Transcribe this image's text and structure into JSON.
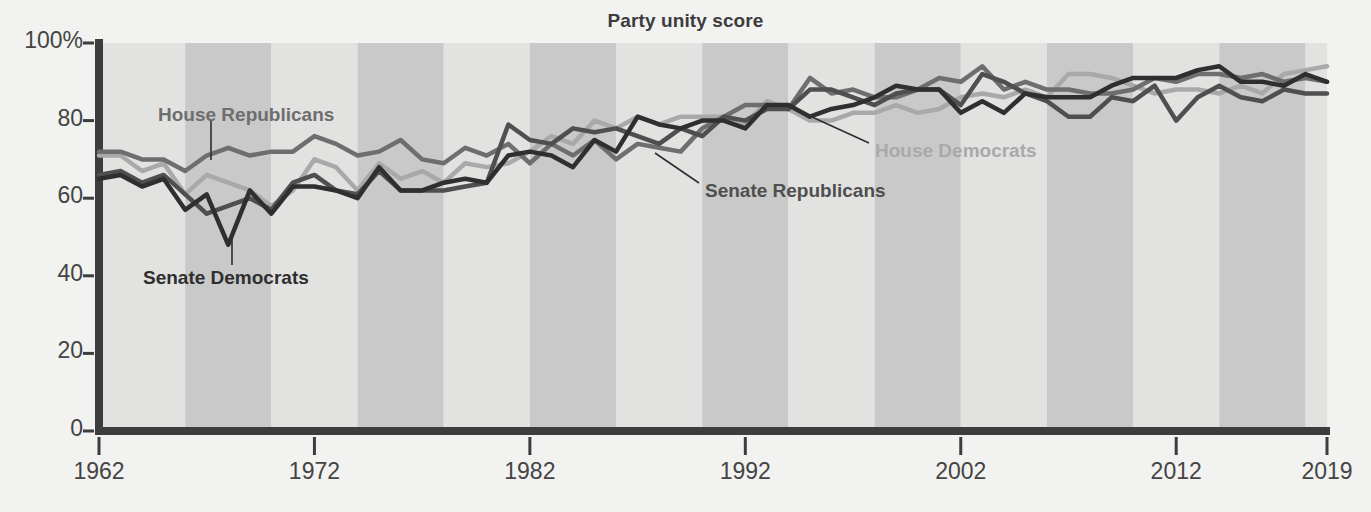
{
  "chart_data": {
    "type": "line",
    "title": "Party unity score",
    "xlabel": "",
    "ylabel": "",
    "xlim": [
      1962,
      2019
    ],
    "ylim": [
      0,
      100
    ],
    "grid": false,
    "legend_position": "inline-annotations",
    "x_tick_labels": [
      "1962",
      "1972",
      "1982",
      "1992",
      "2002",
      "2012",
      "2019"
    ],
    "x_ticks": [
      1962,
      1972,
      1982,
      1992,
      2002,
      2012,
      2019
    ],
    "y_tick_labels": [
      "0",
      "20",
      "40",
      "60",
      "80",
      "100%"
    ],
    "y_ticks": [
      0,
      20,
      40,
      60,
      80,
      100
    ],
    "x": [
      1962,
      1963,
      1964,
      1965,
      1966,
      1967,
      1968,
      1969,
      1970,
      1971,
      1972,
      1973,
      1974,
      1975,
      1976,
      1977,
      1978,
      1979,
      1980,
      1981,
      1982,
      1983,
      1984,
      1985,
      1986,
      1987,
      1988,
      1989,
      1990,
      1991,
      1992,
      1993,
      1994,
      1995,
      1996,
      1997,
      1998,
      1999,
      2000,
      2001,
      2002,
      2003,
      2004,
      2005,
      2006,
      2007,
      2008,
      2009,
      2010,
      2011,
      2012,
      2013,
      2014,
      2015,
      2016,
      2017,
      2018,
      2019
    ],
    "series": [
      {
        "name": "House Republicans",
        "color": "#6e6e6e",
        "values": [
          72,
          72,
          70,
          70,
          67,
          71,
          73,
          71,
          72,
          72,
          76,
          74,
          71,
          72,
          75,
          70,
          69,
          73,
          71,
          74,
          69,
          74,
          71,
          75,
          70,
          74,
          73,
          72,
          78,
          81,
          84,
          84,
          83,
          91,
          87,
          88,
          86,
          86,
          88,
          91,
          90,
          94,
          88,
          90,
          88,
          88,
          87,
          87,
          88,
          91,
          90,
          92,
          92,
          91,
          92,
          90,
          91,
          90
        ]
      },
      {
        "name": "House Democrats",
        "color": "#a9a9a9",
        "values": [
          71,
          71,
          67,
          69,
          61,
          66,
          64,
          62,
          58,
          62,
          70,
          68,
          62,
          69,
          65,
          67,
          64,
          69,
          68,
          69,
          72,
          76,
          74,
          80,
          78,
          81,
          79,
          81,
          81,
          81,
          79,
          85,
          83,
          80,
          80,
          82,
          82,
          84,
          82,
          83,
          86,
          87,
          86,
          88,
          86,
          92,
          92,
          91,
          89,
          87,
          88,
          88,
          87,
          89,
          87,
          92,
          93,
          94
        ]
      },
      {
        "name": "Senate Republicans",
        "color": "#4f4f4f",
        "values": [
          66,
          67,
          64,
          66,
          61,
          56,
          58,
          60,
          57,
          64,
          66,
          62,
          61,
          67,
          62,
          62,
          62,
          63,
          64,
          79,
          75,
          74,
          78,
          77,
          78,
          76,
          74,
          78,
          76,
          81,
          80,
          83,
          83,
          88,
          88,
          86,
          84,
          87,
          88,
          88,
          84,
          92,
          90,
          87,
          85,
          81,
          81,
          86,
          85,
          89,
          80,
          86,
          89,
          86,
          85,
          88,
          87,
          87
        ]
      },
      {
        "name": "Senate Democrats",
        "color": "#2f2f2f",
        "values": [
          65,
          66,
          63,
          65,
          57,
          61,
          48,
          62,
          56,
          63,
          63,
          62,
          60,
          68,
          62,
          62,
          64,
          65,
          64,
          71,
          72,
          71,
          68,
          75,
          72,
          81,
          79,
          78,
          80,
          80,
          78,
          84,
          84,
          81,
          83,
          84,
          86,
          89,
          88,
          88,
          82,
          85,
          82,
          87,
          86,
          86,
          86,
          89,
          91,
          91,
          91,
          93,
          94,
          90,
          90,
          89,
          92,
          90
        ]
      }
    ],
    "annotations": [
      {
        "name": "House Republicans",
        "text": "House Republicans",
        "color": "#6e6e6e",
        "label_x": 158,
        "label_y": 104,
        "leader": {
          "x1": 211,
          "y1": 120,
          "x2": 211,
          "y2": 160
        }
      },
      {
        "name": "Senate Democrats",
        "text": "Senate Democrats",
        "color": "#2f2f2f",
        "label_x": 143,
        "label_y": 267,
        "leader": {
          "x1": 232,
          "y1": 265,
          "x2": 232,
          "y2": 232
        }
      },
      {
        "name": "Senate Republicans",
        "text": "Senate Republicans",
        "color": "#4f4f4f",
        "label_x": 705,
        "label_y": 180,
        "leader": {
          "x1": 699,
          "y1": 183,
          "x2": 655,
          "y2": 153
        }
      },
      {
        "name": "House Democrats",
        "text": "House Democrats",
        "color": "#a9a9a9",
        "label_x": 875,
        "label_y": 140,
        "leader": {
          "x1": 869,
          "y1": 143,
          "x2": 812,
          "y2": 117
        }
      }
    ],
    "background_bands": {
      "light_color": "#e2e2e1",
      "dark_color": "#c9c9c9",
      "band_years": 4,
      "band_start_year": 1962
    },
    "axis_color": "#3d3d3d",
    "page_background": "#f2f2f0"
  }
}
